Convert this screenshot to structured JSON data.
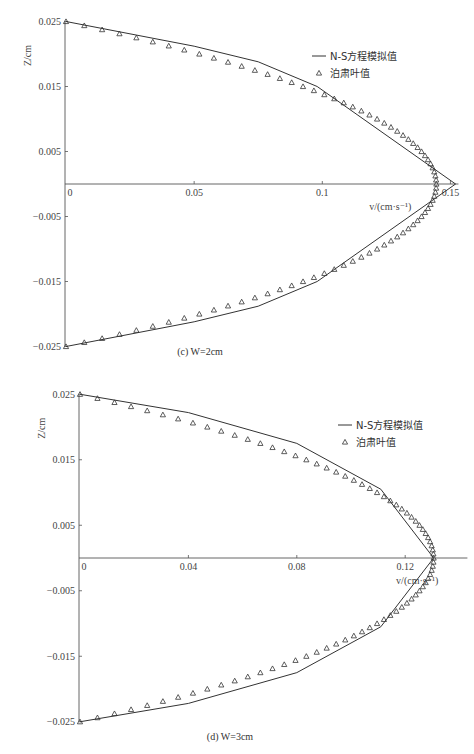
{
  "chart_data": [
    {
      "id": "c",
      "type": "line",
      "caption": "(c) W=2cm",
      "xlabel": "v/(cm·s⁻¹)",
      "ylabel": "Z/cm",
      "xlim": [
        0,
        0.15
      ],
      "ylim": [
        -0.025,
        0.025
      ],
      "xticks": [
        0,
        0.05,
        0.1,
        0.15
      ],
      "xtick_labels": [
        "0",
        "0.05",
        "0.1",
        "0.15"
      ],
      "yticks": [
        0.025,
        0.015,
        0.005,
        -0.005,
        -0.015,
        -0.025
      ],
      "ytick_labels": [
        "0.025",
        "0.015",
        "0.005",
        "−0.005",
        "−0.015",
        "−0.025"
      ],
      "legend": [
        "N-S方程模拟值",
        "泊肃叶值"
      ],
      "legend_position": "upper right",
      "series": [
        {
          "name": "N-S方程模拟值",
          "style": "line",
          "points": [
            [
              0,
              0.025
            ],
            [
              0.05,
              0.0212
            ],
            [
              0.075,
              0.0188
            ],
            [
              0.098,
              0.015
            ],
            [
              0.152,
              0.0
            ],
            [
              0.098,
              -0.015
            ],
            [
              0.075,
              -0.0188
            ],
            [
              0.05,
              -0.0212
            ],
            [
              0,
              -0.025
            ]
          ]
        },
        {
          "name": "泊肃叶值",
          "style": "triangle-markers",
          "vmax": 0.1445,
          "zmax": 0.025,
          "n_points": 81,
          "profile": "v = vmax·(1 − (z/zmax)²)",
          "points_sample": [
            [
              0,
              0.025
            ],
            [
              0.0376,
              0.0215
            ],
            [
              0.0694,
              0.018
            ],
            [
              0.0997,
              0.015
            ],
            [
              0.1156,
              0.0112
            ],
            [
              0.13,
              0.0079
            ],
            [
              0.1387,
              0.005
            ],
            [
              0.1445,
              0.0
            ],
            [
              0.1387,
              -0.005
            ],
            [
              0.13,
              -0.0079
            ],
            [
              0.0997,
              -0.015
            ],
            [
              0.0376,
              -0.0215
            ],
            [
              0,
              -0.025
            ]
          ]
        }
      ]
    },
    {
      "id": "d",
      "type": "line",
      "caption": "(d) W=3cm",
      "xlabel": "v/(cm·s⁻¹)",
      "ylabel": "Z/cm",
      "xlim": [
        0,
        0.14
      ],
      "ylim": [
        -0.025,
        0.025
      ],
      "xticks": [
        0,
        0.04,
        0.08,
        0.12
      ],
      "xtick_labels": [
        "0",
        "0.04",
        "0.08",
        "0.12"
      ],
      "yticks": [
        0.025,
        0.015,
        0.005,
        -0.005,
        -0.015,
        -0.025
      ],
      "ytick_labels": [
        "0.025",
        "0.015",
        "0.005",
        "−0.005",
        "−0.015",
        "−0.025"
      ],
      "legend": [
        "N-S方程模拟值",
        "泊肃叶值"
      ],
      "legend_position": "upper right",
      "series": [
        {
          "name": "N-S方程模拟值",
          "style": "line",
          "points": [
            [
              0,
              0.025
            ],
            [
              0.04,
              0.0222
            ],
            [
              0.08,
              0.0175
            ],
            [
              0.111,
              0.0105
            ],
            [
              0.1305,
              0.0
            ],
            [
              0.111,
              -0.0105
            ],
            [
              0.08,
              -0.0175
            ],
            [
              0.04,
              -0.0222
            ],
            [
              0,
              -0.025
            ]
          ]
        },
        {
          "name": "泊肃叶值",
          "style": "triangle-markers",
          "vmax": 0.1305,
          "zmax": 0.025,
          "n_points": 81,
          "profile": "v = vmax·(1 − (z/zmax)²)",
          "points_sample": [
            [
              0,
              0.025
            ],
            [
              0.0401,
              0.0217
            ],
            [
              0.0797,
              0.0163
            ],
            [
              0.111,
              0.0098
            ],
            [
              0.1253,
              0.005
            ],
            [
              0.1305,
              0.0
            ],
            [
              0.1253,
              -0.005
            ],
            [
              0.111,
              -0.0098
            ],
            [
              0.0797,
              -0.0163
            ],
            [
              0.0401,
              -0.0217
            ],
            [
              0,
              -0.025
            ]
          ]
        }
      ]
    }
  ],
  "layout": [
    {
      "x0": 66,
      "xscale": 2563,
      "yzero": 184,
      "yscale": 6500,
      "caption_x": 200,
      "caption_y": 355,
      "legend_x": 330,
      "legend_y": 56
    },
    {
      "x0": 80,
      "xscale": 2710,
      "yzero": 558,
      "yscale": 6550,
      "caption_x": 230,
      "caption_y": 740,
      "legend_x": 356,
      "legend_y": 425
    }
  ]
}
